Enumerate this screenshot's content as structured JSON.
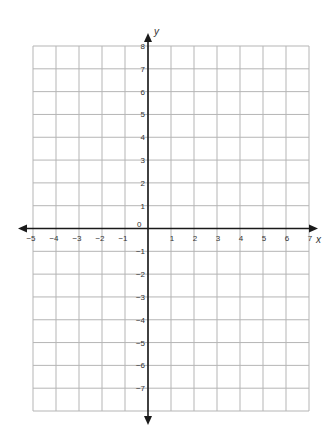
{
  "chart_data": {
    "type": "coordinate-grid",
    "title": "",
    "xlabel": "x",
    "ylabel": "y",
    "xlim": [
      -5,
      7
    ],
    "ylim": [
      -8,
      8
    ],
    "x_ticks": [
      -5,
      -4,
      -3,
      -2,
      -1,
      1,
      2,
      3,
      4,
      5,
      6,
      7
    ],
    "y_ticks": [
      8,
      7,
      6,
      5,
      4,
      3,
      2,
      1,
      -1,
      -2,
      -3,
      -4,
      -5,
      -6,
      -7
    ],
    "origin_label": "0",
    "grid": true,
    "series": []
  },
  "colors": {
    "grid": "#b5b5b5",
    "axis": "#1a1a1a",
    "text": "#333333",
    "background": "#ffffff"
  }
}
